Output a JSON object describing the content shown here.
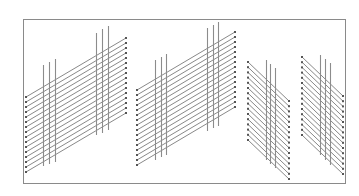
{
  "diagram": {
    "width": 359,
    "height": 196,
    "background": "#ffffff",
    "frame": {
      "x": 23,
      "y": 19,
      "w": 322,
      "h": 164,
      "stroke": "#8a8a8a"
    },
    "line_color": "#7a7a7a",
    "dot_color": "#555555",
    "bar_color": "#8c8c8c",
    "panels": [
      {
        "name": "panel-1",
        "count": 16,
        "spacing": 5,
        "left_x": 26,
        "left_y0": 97,
        "right_x": 126,
        "right_y0": 38,
        "bars": [
          {
            "x": 43,
            "top": 65,
            "bottom": 166
          },
          {
            "x": 49,
            "top": 62,
            "bottom": 164
          },
          {
            "x": 55,
            "top": 59,
            "bottom": 162
          },
          {
            "x": 96,
            "top": 33,
            "bottom": 135
          },
          {
            "x": 102,
            "top": 29,
            "bottom": 133
          },
          {
            "x": 108,
            "top": 26,
            "bottom": 130
          }
        ]
      },
      {
        "name": "panel-2",
        "count": 16,
        "spacing": 5,
        "left_x": 137,
        "left_y0": 90,
        "right_x": 235,
        "right_y0": 32,
        "bars": [
          {
            "x": 155,
            "top": 60,
            "bottom": 160
          },
          {
            "x": 161,
            "top": 57,
            "bottom": 157
          },
          {
            "x": 166,
            "top": 54,
            "bottom": 155
          },
          {
            "x": 207,
            "top": 28,
            "bottom": 131
          },
          {
            "x": 213,
            "top": 25,
            "bottom": 128
          },
          {
            "x": 218,
            "top": 22,
            "bottom": 126
          }
        ]
      },
      {
        "name": "panel-3",
        "count": 16,
        "spacing": 5.2,
        "left_x": 248,
        "left_y0": 62,
        "right_x": 289,
        "right_y0": 101,
        "bars": [
          {
            "x": 266,
            "top": 60,
            "bottom": 160
          },
          {
            "x": 270,
            "top": 64,
            "bottom": 164
          },
          {
            "x": 275,
            "top": 68,
            "bottom": 168
          }
        ]
      },
      {
        "name": "panel-4",
        "count": 16,
        "spacing": 5.2,
        "left_x": 302,
        "left_y0": 57,
        "right_x": 343,
        "right_y0": 96,
        "bars": [
          {
            "x": 320,
            "top": 55,
            "bottom": 155
          },
          {
            "x": 325,
            "top": 59,
            "bottom": 160
          },
          {
            "x": 330,
            "top": 63,
            "bottom": 165
          }
        ]
      }
    ]
  }
}
